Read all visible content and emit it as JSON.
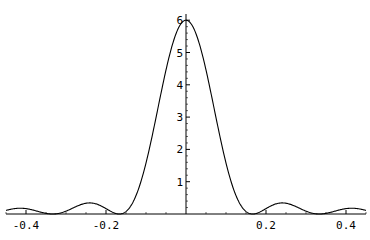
{
  "chart_data": {
    "type": "line",
    "title": "",
    "xlabel": "",
    "ylabel": "",
    "function": "Fejer kernel (1/6)*(sin(6*pi*x)/sin(pi*x))^2",
    "xlim": [
      -0.5,
      0.5
    ],
    "ylim": [
      0,
      6
    ],
    "grid": false,
    "legend": null,
    "x_ticks": [
      -0.4,
      -0.2,
      0.2,
      0.4
    ],
    "x_tick_labels": [
      "-0.4",
      "-0.2",
      "0.2",
      "0.4"
    ],
    "y_ticks": [
      1,
      2,
      3,
      4,
      5,
      6
    ],
    "y_tick_labels": [
      "1",
      "2",
      "3",
      "4",
      "5",
      "6"
    ],
    "series": [
      {
        "name": "curve",
        "x": [
          -0.5,
          -0.45,
          -0.4167,
          -0.4,
          -0.3333,
          -0.3,
          -0.25,
          -0.2,
          -0.1667,
          -0.15,
          -0.1,
          -0.05,
          0,
          0.05,
          0.1,
          0.15,
          0.1667,
          0.2,
          0.25,
          0.3,
          0.3333,
          0.4,
          0.4167,
          0.45,
          0.5
        ],
        "values": [
          0.0,
          0.34,
          0.44,
          0.4,
          0.0,
          0.22,
          0.67,
          0.25,
          0.0,
          0.06,
          1.91,
          4.86,
          6.0,
          4.86,
          1.91,
          0.06,
          0.0,
          0.25,
          0.67,
          0.22,
          0.0,
          0.4,
          0.44,
          0.34,
          0.0
        ]
      }
    ]
  },
  "axes": {
    "x_labels": [
      "-0.4",
      "-0.2",
      "0.2",
      "0.4"
    ],
    "y_labels": [
      "1",
      "2",
      "3",
      "4",
      "5",
      "6"
    ]
  }
}
